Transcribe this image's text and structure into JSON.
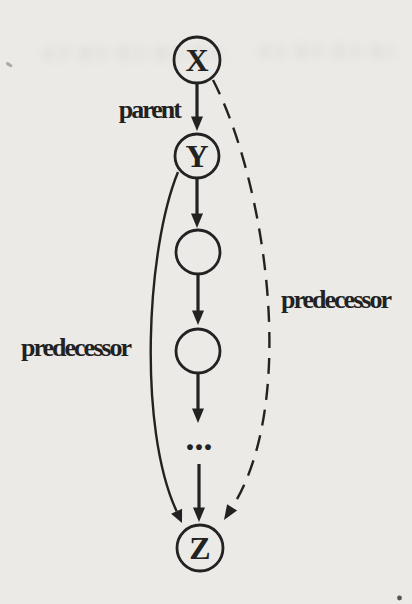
{
  "figure": {
    "type": "graph-diagram",
    "nodes": [
      {
        "id": "x",
        "label": "X"
      },
      {
        "id": "y",
        "label": "Y"
      },
      {
        "id": "mid1",
        "label": ""
      },
      {
        "id": "mid2",
        "label": ""
      },
      {
        "id": "z",
        "label": "Z"
      }
    ],
    "ellipsis": "...",
    "edges": [
      {
        "from": "x",
        "to": "y",
        "style": "solid-arrow",
        "label": "parent"
      },
      {
        "from": "y",
        "to": "mid1",
        "style": "solid-arrow",
        "label": ""
      },
      {
        "from": "mid1",
        "to": "mid2",
        "style": "solid-arrow",
        "label": ""
      },
      {
        "from": "mid2",
        "to": "ellipsis",
        "style": "solid-arrow",
        "label": ""
      },
      {
        "from": "ellipsis",
        "to": "z",
        "style": "solid-arrow",
        "label": ""
      },
      {
        "from": "y",
        "to": "z",
        "style": "solid-curve-left",
        "label": "predecessor"
      },
      {
        "from": "x",
        "to": "z",
        "style": "dashed-curve-right",
        "label": "predecessor"
      }
    ],
    "colors": {
      "ink": "#222222",
      "paper": "#ebeae6"
    }
  }
}
